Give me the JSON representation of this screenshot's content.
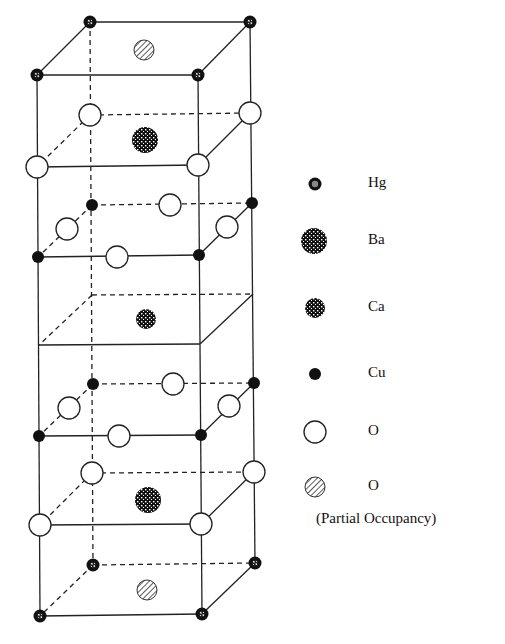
{
  "diagram": {
    "colors": {
      "line": "#222222",
      "atom_fill_dark": "#111111",
      "background": "#ffffff"
    },
    "legend": [
      {
        "symbol": "Hg",
        "label": "Hg",
        "style": "hg"
      },
      {
        "symbol": "Ba",
        "label": "Ba",
        "style": "ba"
      },
      {
        "symbol": "Ca",
        "label": "Ca",
        "style": "ca"
      },
      {
        "symbol": "Cu",
        "label": "Cu",
        "style": "cu"
      },
      {
        "symbol": "O",
        "label": "O",
        "style": "o"
      },
      {
        "symbol": "O-partial",
        "label": "O",
        "style": "opart"
      }
    ],
    "legend_note": "(Partial Occupancy)"
  }
}
